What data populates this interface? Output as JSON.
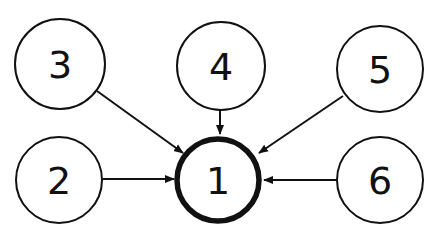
{
  "diagram": {
    "type": "directed-graph",
    "nodes": [
      {
        "id": "1",
        "label": "1",
        "cx": 218,
        "cy": 180,
        "r": 41,
        "emphasized": true
      },
      {
        "id": "2",
        "label": "2",
        "cx": 59,
        "cy": 180,
        "r": 43,
        "emphasized": false
      },
      {
        "id": "3",
        "label": "3",
        "cx": 60,
        "cy": 64,
        "r": 45,
        "emphasized": false
      },
      {
        "id": "4",
        "label": "4",
        "cx": 221,
        "cy": 66,
        "r": 44,
        "emphasized": false
      },
      {
        "id": "5",
        "label": "5",
        "cx": 380,
        "cy": 69,
        "r": 43,
        "emphasized": false
      },
      {
        "id": "6",
        "label": "6",
        "cx": 380,
        "cy": 180,
        "r": 43,
        "emphasized": false
      }
    ],
    "edges": [
      {
        "from": "2",
        "to": "1"
      },
      {
        "from": "3",
        "to": "1"
      },
      {
        "from": "4",
        "to": "1"
      },
      {
        "from": "5",
        "to": "1"
      },
      {
        "from": "6",
        "to": "1"
      }
    ],
    "colors": {
      "stroke": "#111111",
      "background": "#ffffff"
    }
  }
}
